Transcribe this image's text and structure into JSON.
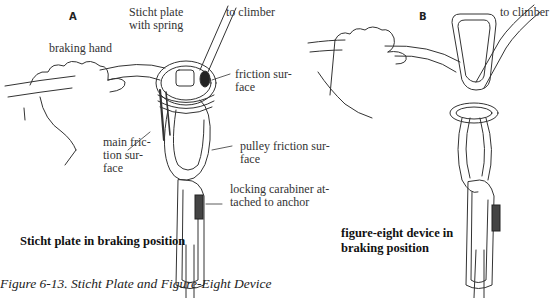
{
  "figure": {
    "caption": "Figure 6-13. Sticht Plate and Figure-Eight Device"
  },
  "panels": [
    {
      "id": "A",
      "caption": "Sticht plate in braking position",
      "labels": {
        "device": "Sticht plate\nwith spring",
        "climber": "to climber",
        "hand": "braking hand",
        "friction": "friction sur-\nface",
        "main_friction": "main fric-\ntion sur-\nface",
        "pulley": "pulley friction sur-\nface",
        "carabiner": "locking carabiner at-\ntached to anchor"
      }
    },
    {
      "id": "B",
      "caption": "figure-eight device in\nbraking position",
      "labels": {
        "climber": "to climber"
      }
    }
  ]
}
